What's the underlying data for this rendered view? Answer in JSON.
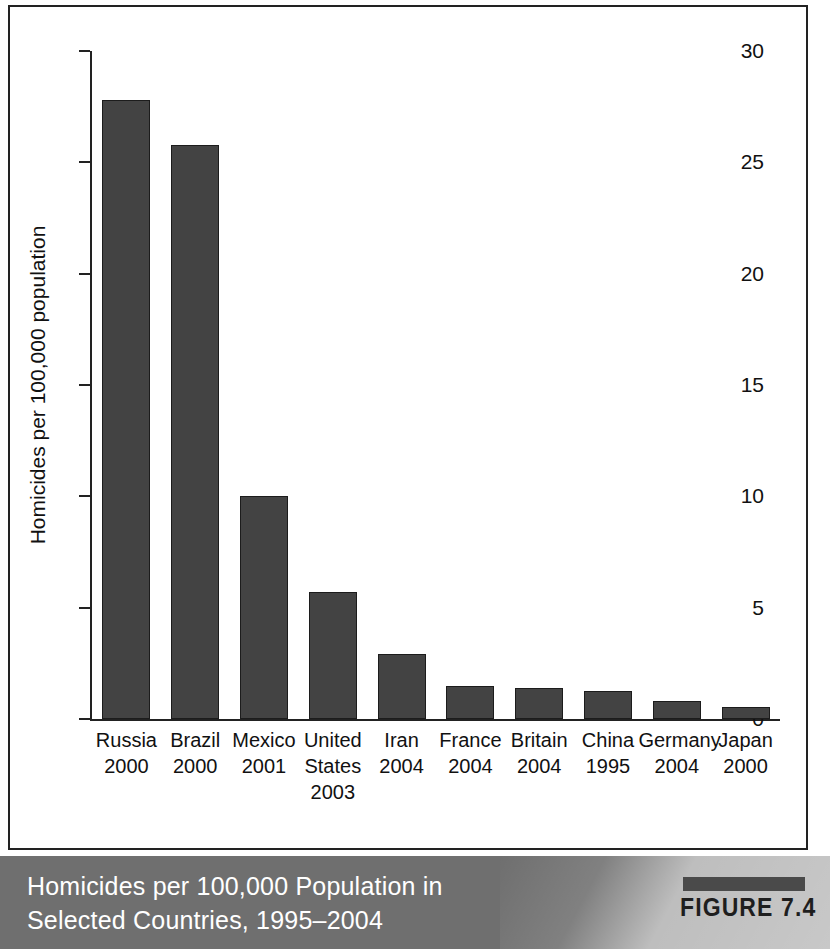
{
  "figure": {
    "tag_label": "FIGURE 7.4",
    "caption_line_1": "Homicides per 100,000 Population in",
    "caption_line_2": "Selected Countries, 1995–2004",
    "band_color": "#6f6f6f",
    "bar_color": "#434343"
  },
  "chart_data": {
    "type": "bar",
    "title": "Homicides per 100,000 Population in Selected Countries, 1995–2004",
    "xlabel": "",
    "ylabel": "Homicides per 100,000 population",
    "ylim": [
      0,
      30
    ],
    "yticks": [
      0,
      5,
      10,
      15,
      20,
      25,
      30
    ],
    "ytick_labels": [
      "0",
      "5",
      "10",
      "15",
      "20",
      "25",
      "30"
    ],
    "grid": false,
    "legend": false,
    "categories": [
      "Russia",
      "Brazil",
      "Mexico",
      "United States",
      "Iran",
      "France",
      "Britain",
      "China",
      "Germany",
      "Japan"
    ],
    "category_years": [
      "2000",
      "2000",
      "2001",
      "2003",
      "2004",
      "2004",
      "2004",
      "1995",
      "2004",
      "2000"
    ],
    "category_lines": [
      [
        "Russia",
        "2000"
      ],
      [
        "Brazil",
        "2000"
      ],
      [
        "Mexico",
        "2001"
      ],
      [
        "United",
        "States",
        "2003"
      ],
      [
        "Iran",
        "2004"
      ],
      [
        "France",
        "2004"
      ],
      [
        "Britain",
        "2004"
      ],
      [
        "China",
        "1995"
      ],
      [
        "Germany",
        "2004"
      ],
      [
        "Japan",
        "2000"
      ]
    ],
    "values": [
      27.8,
      25.8,
      10.0,
      5.7,
      2.9,
      1.5,
      1.4,
      1.25,
      0.8,
      0.55
    ]
  }
}
